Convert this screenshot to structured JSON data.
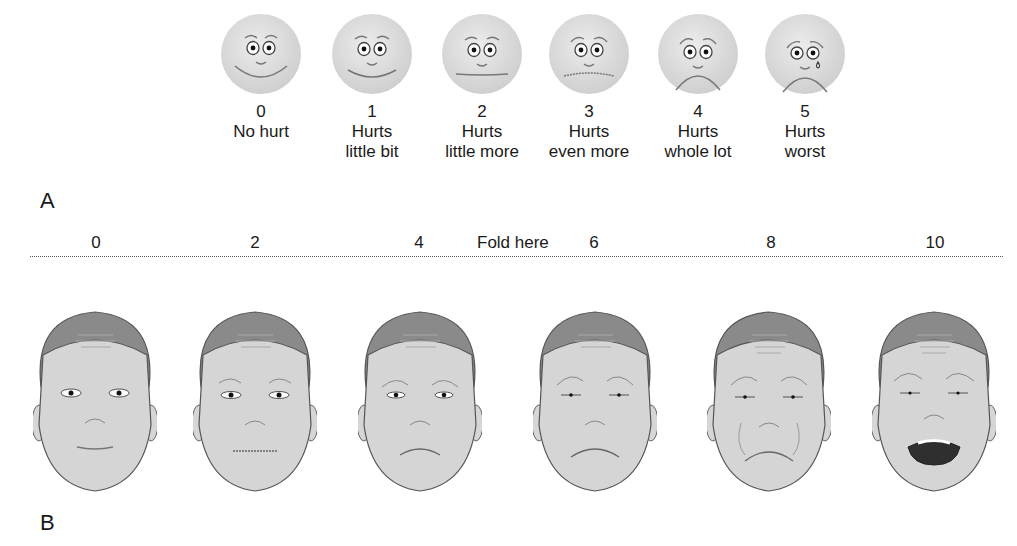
{
  "panel_a": {
    "label": "A",
    "faces": [
      {
        "score": "0",
        "line1": "No hurt",
        "line2": "",
        "expression": "big-smile"
      },
      {
        "score": "1",
        "line1": "Hurts",
        "line2": "little bit",
        "expression": "smile"
      },
      {
        "score": "2",
        "line1": "Hurts",
        "line2": "little more",
        "expression": "flat"
      },
      {
        "score": "3",
        "line1": "Hurts",
        "line2": "even more",
        "expression": "slight-frown"
      },
      {
        "score": "4",
        "line1": "Hurts",
        "line2": "whole lot",
        "expression": "frown"
      },
      {
        "score": "5",
        "line1": "Hurts",
        "line2": "worst",
        "expression": "frown-tear"
      }
    ]
  },
  "panel_b": {
    "label": "B",
    "fold_text": "Fold here",
    "scale": [
      "0",
      "2",
      "4",
      "6",
      "8",
      "10"
    ],
    "faces": [
      {
        "score": "0",
        "expression": "neutral"
      },
      {
        "score": "2",
        "expression": "mild-concern"
      },
      {
        "score": "4",
        "expression": "frown"
      },
      {
        "score": "6",
        "expression": "squint-frown"
      },
      {
        "score": "8",
        "expression": "grimace"
      },
      {
        "score": "10",
        "expression": "open-mouth-cry"
      }
    ]
  },
  "colors": {
    "cartoon_face": "#d9d9d9",
    "skin": "#d4d4d4",
    "hair": "#8a8a8a",
    "outline": "#555555",
    "text": "#1a1a1a"
  }
}
